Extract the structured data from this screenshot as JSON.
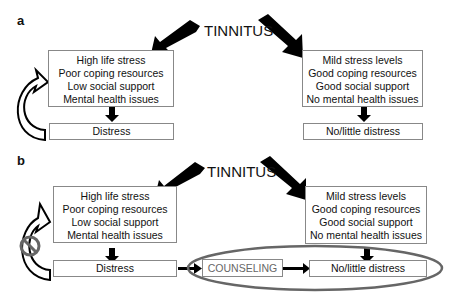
{
  "panels": [
    {
      "label": "a",
      "title": "TINNITUS",
      "left_box": [
        "High life stress",
        "Poor coping resources",
        "Low social support",
        "Mental health issues"
      ],
      "left_outcome": "Distress",
      "right_box": [
        "Mild stress levels",
        "Good coping resources",
        "Good social support",
        "No mental health issues"
      ],
      "right_outcome": "No/little distress"
    },
    {
      "label": "b",
      "title": "TINNITUS",
      "left_box": [
        "High life stress",
        "Poor coping resources",
        "Low social support",
        "Mental health issues"
      ],
      "left_outcome": "Distress",
      "intervention": "COUNSELING",
      "right_box": [
        "Mild stress levels",
        "Good coping resources",
        "Good social support",
        "No mental health issues"
      ],
      "right_outcome": "No/little distress"
    }
  ]
}
